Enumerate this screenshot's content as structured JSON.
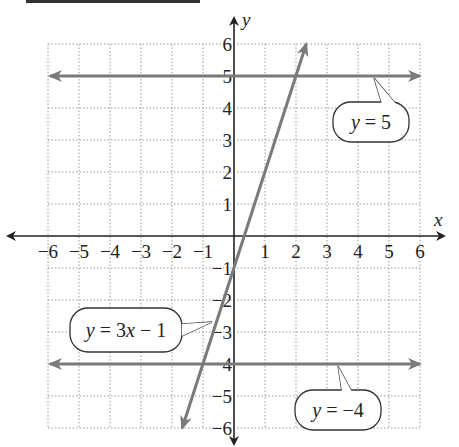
{
  "chart_data": {
    "type": "line",
    "title": "",
    "xlabel": "x",
    "ylabel": "y",
    "xlim": [
      -6,
      6
    ],
    "ylim": [
      -6,
      6
    ],
    "grid": true,
    "x_ticks": [
      "−6",
      "−5",
      "−4",
      "−3",
      "−2",
      "−1",
      "1",
      "2",
      "3",
      "4",
      "5",
      "6"
    ],
    "y_ticks": [
      "6",
      "5",
      "4",
      "3",
      "2",
      "1",
      "−1",
      "−2",
      "−3",
      "−4",
      "−5",
      "−6"
    ],
    "series": [
      {
        "name": "y = 5",
        "equation": "y = 5",
        "x": [
          -6,
          6
        ],
        "y": [
          5,
          5
        ],
        "color": "#7a7a7a"
      },
      {
        "name": "y = 3x − 1",
        "equation": "y = 3x − 1",
        "x": [
          -1.67,
          2.33
        ],
        "y": [
          -6,
          6
        ],
        "color": "#7a7a7a"
      },
      {
        "name": "y = −4",
        "equation": "y = −4",
        "x": [
          -6,
          6
        ],
        "y": [
          -4,
          -4
        ],
        "color": "#7a7a7a"
      }
    ],
    "annotations": [
      {
        "text": "y = 5",
        "points_to": "line y = 5"
      },
      {
        "text": "y = 3x − 1",
        "points_to": "line y = 3x − 1"
      },
      {
        "text": "y = −4",
        "points_to": "line y = −4"
      }
    ]
  },
  "labels": {
    "x_axis": "x",
    "y_axis": "y",
    "callout_y5_var": "y",
    "callout_y5_rest": " = 5",
    "callout_line_var": "y",
    "callout_line_mid": " = 3",
    "callout_line_x": "x",
    "callout_line_rest": " − 1",
    "callout_ym4_var": "y",
    "callout_ym4_rest": " =  −4"
  },
  "colors": {
    "line": "#7a7a7a",
    "axis": "#222222",
    "grid": "#9a9a9a"
  }
}
